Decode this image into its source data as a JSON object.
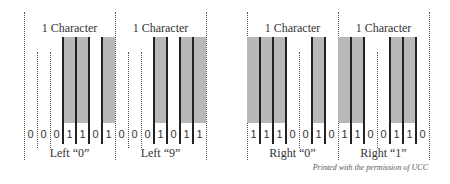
{
  "figure": {
    "caption": "Printed with the permission of UCC",
    "module_width_px": 13,
    "bar_color": "#b8b8b8",
    "line_color": "#222222"
  },
  "characters": [
    {
      "title": "1 Character",
      "label": "Left “0”",
      "bits": [
        0,
        0,
        0,
        1,
        1,
        0,
        1
      ],
      "x0": 24
    },
    {
      "title": "1 Character",
      "label": "Left “9”",
      "bits": [
        0,
        0,
        0,
        1,
        0,
        1,
        1
      ],
      "x0": 115
    },
    {
      "title": "1 Character",
      "label": "Right “0”",
      "bits": [
        1,
        1,
        1,
        0,
        0,
        1,
        0
      ],
      "x0": 247
    },
    {
      "title": "1 Character",
      "label": "Right “1”",
      "bits": [
        1,
        1,
        0,
        0,
        1,
        1,
        0
      ],
      "x0": 338
    }
  ]
}
